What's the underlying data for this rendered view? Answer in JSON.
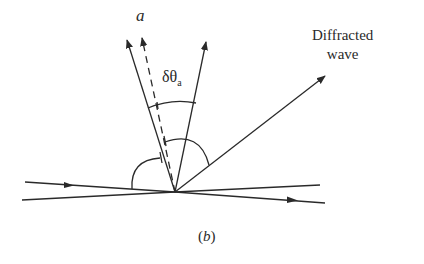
{
  "figure": {
    "caption": "(b)",
    "caption_letter": "b",
    "labels": {
      "vector": "a",
      "angle_symbol": "δθ",
      "angle_subscript": "a",
      "diffracted_line1": "Diffracted",
      "diffracted_line2": "wave"
    },
    "colors": {
      "stroke": "#2a2a2a",
      "background": "#ffffff"
    }
  }
}
